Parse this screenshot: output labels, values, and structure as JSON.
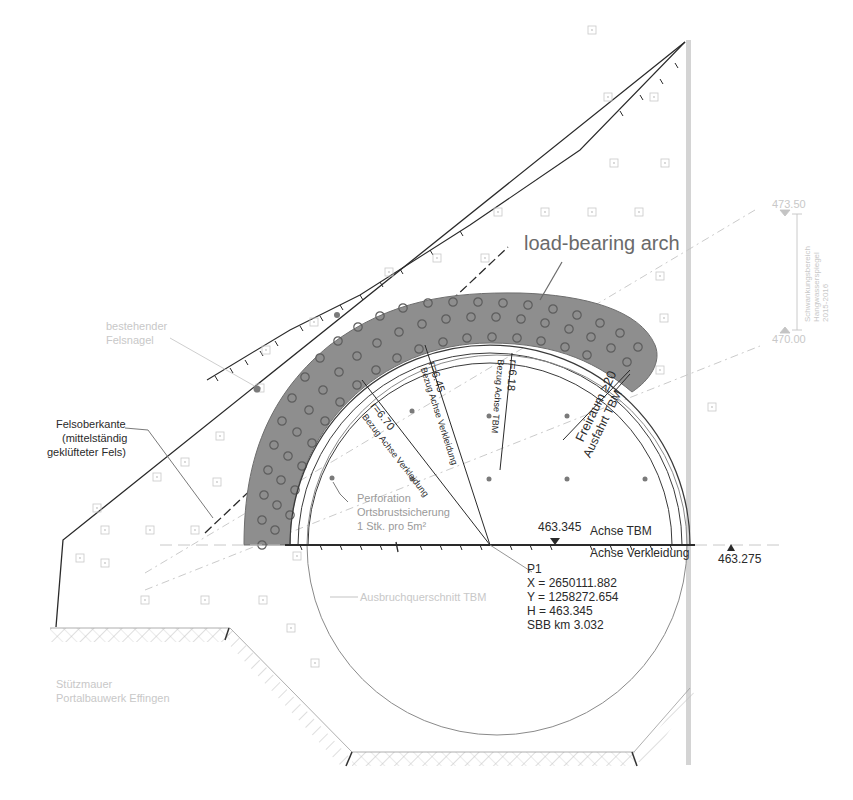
{
  "diagram": {
    "type": "tunnel-cross-section",
    "callouts": {
      "load_bearing_arch": "load-bearing arch",
      "existing_rock_nail_line1": "bestehender",
      "existing_rock_nail_line2": "Felsnagel",
      "rock_surface_line1": "Felsoberkante",
      "rock_surface_line2": "(mittelständig",
      "rock_surface_line3": "geklüfteter Fels)",
      "perforation_line1": "Perforation",
      "perforation_line2": "Ortsbrustsicherung",
      "perforation_line3": "1 Stk. pro 5m²",
      "excavation_profile": "Ausbruchquerschnitt TBM",
      "retaining_wall_line1": "Stützmauer",
      "retaining_wall_line2": "Portalbauwerk Effingen",
      "fluctuation_zone_line1": "Schwankungsbereich",
      "fluctuation_zone_line2": "Hangwasserspiegel",
      "fluctuation_zone_line3": "2015-2016"
    },
    "radii": {
      "r_670": "r=6.70",
      "r_670_ref": "Bezug Achse Verkleidung",
      "r_645": "r=6.45",
      "r_645_ref": "Bezug Achse Verkleidung",
      "r_618": "r=6.18",
      "r_618_ref": "Bezug Achse TBM",
      "clearance": "Freiraum ≥20",
      "clearance_ref": "Ausfahrt TBM"
    },
    "axes": {
      "tbm_axis_label": "Achse TBM",
      "tbm_axis_elev": "463.345",
      "lining_axis_label": "Achse Verkleidung",
      "lining_axis_elev": "463.275"
    },
    "water_levels": {
      "upper": "473.50",
      "lower": "470.00"
    },
    "point_p1": {
      "name": "P1",
      "x": "X = 2650111.882",
      "y": "Y = 1258272.654",
      "h": "H = 463.345",
      "km": "SBB km 3.032"
    },
    "colors": {
      "arch_fill": "#8c8c8c",
      "line_dark": "#2a2a2a",
      "line_grey": "#9a9a9a",
      "hatch": "#b5b5b5",
      "background": "#ffffff"
    }
  }
}
